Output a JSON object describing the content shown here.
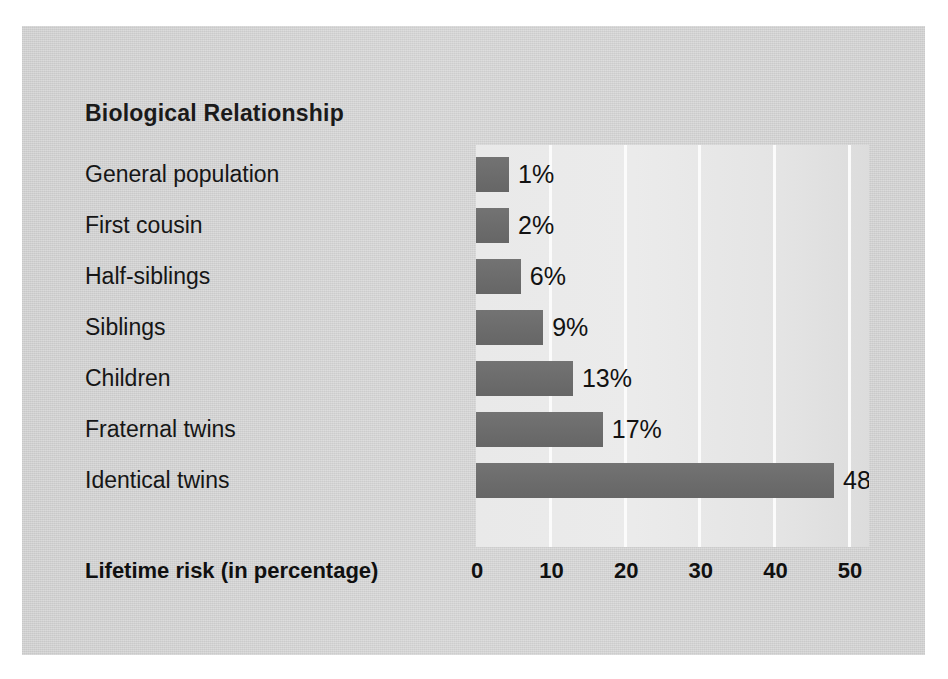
{
  "chart_data": {
    "type": "bar",
    "orientation": "horizontal",
    "title": "Biological Relationship",
    "xlabel": "Lifetime risk (in percentage)",
    "ylabel": "Biological Relationship",
    "categories": [
      "General population",
      "First cousin",
      "Half-siblings",
      "Siblings",
      "Children",
      "Fraternal twins",
      "Identical twins"
    ],
    "values": [
      1,
      2,
      6,
      9,
      13,
      17,
      48
    ],
    "value_labels": [
      "1%",
      "2%",
      "6%",
      "9%",
      "13%",
      "17%",
      "48%"
    ],
    "xticks": [
      0,
      10,
      20,
      30,
      40,
      50
    ],
    "xtick_labels": [
      "0",
      "10",
      "20",
      "30",
      "40",
      "50"
    ],
    "xlim": [
      0,
      52
    ],
    "grid": true,
    "grid_axis": "x",
    "legend": false,
    "bar_color": "#6d6d6d",
    "plot_background": "#e9e9e9",
    "figure_background": "#d2d2d2"
  }
}
